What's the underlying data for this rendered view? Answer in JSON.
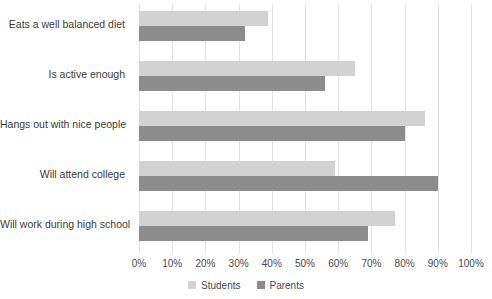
{
  "chart_data": {
    "type": "bar",
    "orientation": "horizontal",
    "title": "",
    "subtitle": "",
    "xlabel": "",
    "ylabel": "",
    "xlim": [
      0,
      100
    ],
    "xtick_labels": [
      "0%",
      "10%",
      "20%",
      "30%",
      "40%",
      "50%",
      "60%",
      "70%",
      "80%",
      "90%",
      "100%"
    ],
    "xticks": [
      0,
      10,
      20,
      30,
      40,
      50,
      60,
      70,
      80,
      90,
      100
    ],
    "grid": true,
    "legend_position": "bottom",
    "categories": [
      "Eats a well balanced diet",
      "Is active enough",
      "Hangs out with nice people",
      "Will attend college",
      "Will work during high school"
    ],
    "series": [
      {
        "name": "Students",
        "color": "#d2d2d2",
        "values": [
          39,
          65,
          86,
          59,
          77
        ]
      },
      {
        "name": "Parents",
        "color": "#8c8c8c",
        "values": [
          32,
          56,
          80,
          90,
          69
        ]
      }
    ]
  },
  "legend": {
    "items": [
      {
        "label": "Students",
        "swatch": "students-swatch"
      },
      {
        "label": "Parents",
        "swatch": "parents-swatch"
      }
    ]
  },
  "colors": {
    "students": "#d2d2d2",
    "parents": "#8c8c8c",
    "gridline": "#e4e4e4",
    "text": "#3c3c3c",
    "background": "#ffffff"
  }
}
